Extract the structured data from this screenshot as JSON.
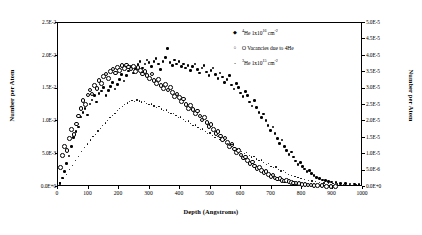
{
  "chart_data": {
    "type": "scatter",
    "title": "",
    "xlabel": "Depth (Angstroms)",
    "ylabel": "Number per Atom",
    "ylabel_right": "Number per Atom",
    "xlim": [
      0,
      1000
    ],
    "ylim": [
      0,
      0.025
    ],
    "ylim_right": [
      0,
      5e-05
    ],
    "grid": false,
    "legend_position": "top-right-inside",
    "xticks": [
      "0",
      "100",
      "200",
      "300",
      "400",
      "500",
      "600",
      "700",
      "800",
      "900",
      "1000"
    ],
    "xtick_values": [
      0,
      100,
      200,
      300,
      400,
      500,
      600,
      700,
      800,
      900,
      1000
    ],
    "yticks": [
      "0.0E+0",
      "5.0E-3",
      "1.0E-2",
      "1.5E-2",
      "2.0E-2",
      "2.5E-2"
    ],
    "ytick_values": [
      0,
      0.005,
      0.01,
      0.015,
      0.02,
      0.025
    ],
    "yticks_right": [
      "0.0E+0",
      "5.0E-6",
      "1.0E-5",
      "1.5E-5",
      "2.0E-5",
      "2.5E-5",
      "3.0E-5",
      "3.5E-5",
      "4.0E-5",
      "4.5E-5",
      "5.0E-5"
    ],
    "ytick_right_values": [
      0,
      5e-06,
      1e-05,
      1.5e-05,
      2e-05,
      2.5e-05,
      3e-05,
      3.5e-05,
      4e-05,
      4.5e-05,
      5e-05
    ],
    "series": [
      {
        "name": "4He 1x10^16 cm-2",
        "label_html": "<sup>4</sup>He 1x10<sup>16</sup> cm<sup>-2</sup>",
        "marker": "filled-diamond",
        "color": "#000000",
        "axis": "left",
        "x": [
          10,
          18,
          25,
          32,
          40,
          48,
          55,
          62,
          70,
          78,
          85,
          92,
          100,
          108,
          115,
          122,
          130,
          138,
          145,
          152,
          160,
          168,
          175,
          182,
          190,
          198,
          205,
          212,
          220,
          228,
          235,
          242,
          250,
          258,
          265,
          272,
          280,
          288,
          295,
          302,
          310,
          318,
          325,
          332,
          340,
          348,
          355,
          362,
          370,
          378,
          385,
          392,
          400,
          408,
          415,
          422,
          430,
          438,
          445,
          452,
          460,
          468,
          475,
          482,
          490,
          498,
          505,
          512,
          520,
          528,
          535,
          542,
          550,
          558,
          565,
          572,
          580,
          588,
          595,
          602,
          610,
          618,
          625,
          632,
          640,
          648,
          655,
          662,
          670,
          678,
          685,
          692,
          700,
          708,
          715,
          722,
          730,
          738,
          745,
          752,
          760,
          768,
          775,
          782,
          790,
          798,
          805,
          812,
          820,
          828,
          835,
          842,
          850,
          860,
          870,
          880,
          890,
          900,
          915,
          930,
          945,
          960,
          975,
          990
        ],
        "y": [
          0.0004,
          0.0012,
          0.0022,
          0.0034,
          0.0046,
          0.006,
          0.0074,
          0.0083,
          0.009,
          0.0105,
          0.0112,
          0.0118,
          0.0108,
          0.0125,
          0.0131,
          0.0138,
          0.0128,
          0.0141,
          0.0145,
          0.015,
          0.0138,
          0.0146,
          0.0152,
          0.0158,
          0.0148,
          0.0155,
          0.0162,
          0.017,
          0.016,
          0.0168,
          0.0175,
          0.0182,
          0.0172,
          0.0178,
          0.0185,
          0.019,
          0.018,
          0.0186,
          0.0192,
          0.0188,
          0.0182,
          0.019,
          0.0194,
          0.0186,
          0.0178,
          0.019,
          0.0196,
          0.021,
          0.0188,
          0.0184,
          0.0192,
          0.0186,
          0.019,
          0.0182,
          0.0186,
          0.018,
          0.0184,
          0.0176,
          0.0182,
          0.0186,
          0.0178,
          0.0172,
          0.018,
          0.0184,
          0.0174,
          0.0168,
          0.0176,
          0.018,
          0.017,
          0.0164,
          0.0172,
          0.0166,
          0.0158,
          0.0162,
          0.0168,
          0.0154,
          0.0148,
          0.0156,
          0.015,
          0.0142,
          0.0136,
          0.0144,
          0.0138,
          0.0128,
          0.0122,
          0.013,
          0.012,
          0.0112,
          0.0104,
          0.011,
          0.01,
          0.0092,
          0.0085,
          0.009,
          0.008,
          0.0072,
          0.0065,
          0.007,
          0.006,
          0.0054,
          0.0048,
          0.0052,
          0.0044,
          0.0038,
          0.0033,
          0.0036,
          0.003,
          0.0026,
          0.0022,
          0.0024,
          0.0019,
          0.0016,
          0.0013,
          0.0011,
          0.0009,
          0.0008,
          0.0007,
          0.0006,
          0.0005,
          0.0004,
          0.0004,
          0.0003,
          0.0003,
          0.0002
        ]
      },
      {
        "name": "O Vacancies due to 4He",
        "label_html": "O Vacancies due to 4He",
        "marker": "open-circle",
        "color": "#000000",
        "axis": "left",
        "x": [
          8,
          15,
          22,
          30,
          38,
          45,
          52,
          60,
          68,
          75,
          82,
          90,
          98,
          105,
          112,
          120,
          128,
          135,
          142,
          150,
          158,
          165,
          172,
          180,
          188,
          195,
          202,
          210,
          218,
          225,
          232,
          240,
          248,
          255,
          262,
          270,
          278,
          285,
          292,
          300,
          308,
          315,
          322,
          330,
          338,
          345,
          352,
          360,
          368,
          375,
          382,
          390,
          398,
          405,
          412,
          420,
          428,
          435,
          442,
          450,
          458,
          465,
          472,
          480,
          488,
          495,
          502,
          510,
          518,
          525,
          532,
          540,
          548,
          555,
          562,
          570,
          578,
          585,
          592,
          600,
          608,
          615,
          622,
          630,
          638,
          645,
          652,
          660,
          668,
          675,
          682,
          690,
          698,
          705,
          712,
          720,
          728,
          735,
          742,
          750,
          758,
          765,
          772,
          780,
          790,
          800,
          810,
          820,
          830,
          840,
          850,
          865,
          880,
          895,
          910
        ],
        "y": [
          0.003,
          0.0048,
          0.0062,
          0.0056,
          0.0074,
          0.0088,
          0.008,
          0.0096,
          0.0108,
          0.012,
          0.0132,
          0.0126,
          0.014,
          0.0148,
          0.0142,
          0.0155,
          0.015,
          0.0162,
          0.0158,
          0.0168,
          0.0172,
          0.0165,
          0.0176,
          0.018,
          0.0174,
          0.0182,
          0.0178,
          0.0185,
          0.0181,
          0.0186,
          0.0183,
          0.018,
          0.0184,
          0.0176,
          0.0182,
          0.0178,
          0.0172,
          0.0176,
          0.017,
          0.0165,
          0.0172,
          0.0162,
          0.0158,
          0.0164,
          0.0155,
          0.015,
          0.0156,
          0.0148,
          0.0152,
          0.0144,
          0.0138,
          0.0142,
          0.0136,
          0.013,
          0.0134,
          0.0126,
          0.012,
          0.0124,
          0.0118,
          0.0112,
          0.0116,
          0.0108,
          0.0102,
          0.0106,
          0.0098,
          0.0092,
          0.0095,
          0.0088,
          0.0082,
          0.0085,
          0.0078,
          0.0072,
          0.0075,
          0.0068,
          0.0062,
          0.0065,
          0.0058,
          0.0053,
          0.0056,
          0.0049,
          0.0044,
          0.0046,
          0.004,
          0.0036,
          0.0038,
          0.0032,
          0.0028,
          0.003,
          0.0025,
          0.0022,
          0.0024,
          0.0019,
          0.0016,
          0.0018,
          0.0014,
          0.0012,
          0.0013,
          0.001,
          0.0009,
          0.001,
          0.0008,
          0.0007,
          0.0006,
          0.0006,
          0.0005,
          0.0004,
          0.0004,
          0.0003,
          0.0003,
          0.0002,
          0.0002,
          0.0002,
          0.0001,
          0.0001,
          0.0001
        ]
      },
      {
        "name": "3He 1x10^15 cm-2",
        "label_html": "<sup>3</sup>He 1x10<sup>15</sup> cm<sup>-2</sup>",
        "marker": "small-dot",
        "color": "#000000",
        "axis": "right",
        "x": [
          10,
          20,
          30,
          40,
          50,
          60,
          70,
          80,
          90,
          100,
          110,
          118,
          126,
          134,
          142,
          150,
          158,
          166,
          174,
          182,
          190,
          198,
          206,
          214,
          222,
          230,
          238,
          246,
          254,
          262,
          270,
          278,
          286,
          294,
          302,
          310,
          318,
          326,
          334,
          342,
          350,
          358,
          366,
          374,
          382,
          390,
          398,
          406,
          414,
          422,
          430,
          438,
          446,
          454,
          462,
          470,
          478,
          486,
          494,
          502,
          510,
          518,
          526,
          534,
          542,
          550,
          558,
          566,
          574,
          582,
          590,
          598,
          606,
          614,
          622,
          630,
          638,
          646,
          654,
          662,
          670,
          678,
          686,
          694,
          702,
          710,
          718,
          726,
          734,
          742,
          750,
          760,
          770,
          780,
          790,
          800,
          812,
          824,
          836,
          848,
          860,
          875,
          890,
          905,
          920,
          940,
          960,
          980
        ],
        "y": [
          1e-06,
          2.2e-06,
          3.5e-06,
          5e-06,
          6.2e-06,
          7.8e-06,
          9e-06,
          1.05e-05,
          1.18e-05,
          1.28e-05,
          1.4e-05,
          1.5e-05,
          1.58e-05,
          1.68e-05,
          1.76e-05,
          1.85e-05,
          1.92e-05,
          2e-05,
          2.08e-05,
          2.15e-05,
          2.22e-05,
          2.3e-05,
          2.36e-05,
          2.42e-05,
          2.48e-05,
          2.53e-05,
          2.57e-05,
          2.6e-05,
          2.58e-05,
          2.62e-05,
          2.59e-05,
          2.56e-05,
          2.58e-05,
          2.52e-05,
          2.48e-05,
          2.5e-05,
          2.44e-05,
          2.4e-05,
          2.42e-05,
          2.35e-05,
          2.3e-05,
          2.32e-05,
          2.25e-05,
          2.2e-05,
          2.22e-05,
          2.14e-05,
          2.08e-05,
          2.1e-05,
          2.02e-05,
          1.96e-05,
          1.98e-05,
          1.9e-05,
          1.84e-05,
          1.86e-05,
          1.78e-05,
          1.72e-05,
          1.74e-05,
          1.66e-05,
          1.6e-05,
          1.62e-05,
          1.54e-05,
          1.48e-05,
          1.5e-05,
          1.42e-05,
          1.36e-05,
          1.38e-05,
          1.3e-05,
          1.24e-05,
          1.26e-05,
          1.18e-05,
          1.12e-05,
          1.14e-05,
          1.06e-05,
          1e-05,
          1.02e-05,
          9.4e-06,
          8.8e-06,
          9e-06,
          8.2e-06,
          7.7e-06,
          7.9e-06,
          7.1e-06,
          6.6e-06,
          6.8e-06,
          6e-06,
          5.6e-06,
          5.8e-06,
          5e-06,
          4.6e-06,
          4.8e-06,
          4.1e-06,
          3.6e-06,
          3.2e-06,
          2.9e-06,
          2.6e-06,
          2.3e-06,
          2e-06,
          1.7e-06,
          1.5e-06,
          1.3e-06,
          1.1e-06,
          9e-07,
          8e-07,
          7e-07,
          6e-07,
          5e-07,
          4e-07,
          3e-07
        ]
      }
    ]
  }
}
